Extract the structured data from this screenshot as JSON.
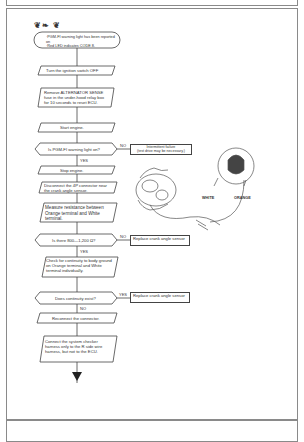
{
  "header": {
    "title_glyphs": "❦❧ ❦"
  },
  "flowchart": {
    "start": "·PGM-FI warning light has been reported on\n·Red LED indicates CODE 8.",
    "steps": [
      {
        "id": "s1",
        "type": "process",
        "text": "Turn the ignition switch OFF"
      },
      {
        "id": "s2",
        "type": "process",
        "text": "Remove ALTERNATOR SENSE fuse in the under-hood relay box for 10 seconds to reset ECU."
      },
      {
        "id": "s3",
        "type": "process",
        "text": "Start engine."
      },
      {
        "id": "d1",
        "type": "decision",
        "text": "Is PGM-FI warning light on?",
        "no_label": "NO",
        "yes_label": "YES",
        "no_result": "Intermittent failure\n(test drive may be necessary.)"
      },
      {
        "id": "s4",
        "type": "process",
        "text": "Stop engine."
      },
      {
        "id": "s5",
        "type": "process",
        "text": "Disconnect the 4P connector near the crank angle sensor."
      },
      {
        "id": "s6",
        "type": "process",
        "text": "Measure resistance between Orange terminal and White terminal."
      },
      {
        "id": "d2",
        "type": "decision",
        "text": "Is there 800—1,200 Ω?",
        "no_label": "NO",
        "yes_label": "YES",
        "no_result": "Replace crank angle sensor"
      },
      {
        "id": "s7",
        "type": "process",
        "text": "Check for continuity to body ground on Orange terminal and White terminal individually."
      },
      {
        "id": "d3",
        "type": "decision",
        "text": "Does continuity exist?",
        "yes_label": "YES",
        "no_label": "NO",
        "yes_result": "Replace crank angle sensor"
      },
      {
        "id": "s8",
        "type": "process",
        "text": "Reconnect the connector."
      },
      {
        "id": "s9",
        "type": "process",
        "text": "Connect the system checker harness only to the R side wire harness, but not to the ECU."
      }
    ]
  },
  "illustration": {
    "label_white": "WHITE",
    "label_orange": "ORANGE"
  }
}
